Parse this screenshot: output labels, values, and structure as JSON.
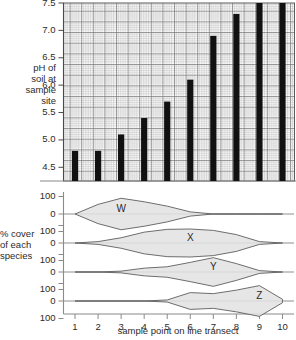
{
  "labels": {
    "y_ph": "pH of\nsoil at\nsample\nsite",
    "y_ph_lines": [
      "pH of",
      "soil at",
      "sample",
      "site"
    ],
    "y_cover_lines": [
      "% cover",
      "of each",
      "species"
    ],
    "x_axis": "sample point on line transect"
  },
  "colors": {
    "bar": "#111111",
    "grid_minor": "#b9b9b9",
    "grid_major": "#6a6a6a",
    "axis": "#8a8a8a",
    "kite_stroke": "#5d5d5d",
    "kite_fill": "#e2e2e2",
    "text": "#2b2b2b"
  },
  "chart_data": [
    {
      "type": "bar",
      "title": "",
      "xlabel": "sample point on line transect",
      "ylabel": "pH of soil at sample site",
      "categories": [
        1,
        2,
        3,
        4,
        5,
        6,
        7,
        8,
        9,
        10
      ],
      "values": [
        4.8,
        4.8,
        5.1,
        5.4,
        5.7,
        6.1,
        6.9,
        7.3,
        7.6,
        7.6
      ],
      "ylim": [
        4.25,
        7.5
      ],
      "ytick_labels": [
        "7.5",
        "7.0",
        "6.5",
        "6.0",
        "5.5",
        "5.0",
        "4.5"
      ],
      "yticks": [
        7.5,
        7.0,
        6.5,
        6.0,
        5.5,
        5.0,
        4.5
      ],
      "grid": "graph-paper minor 0.05 / major 0.25",
      "legend": "none"
    },
    {
      "type": "area",
      "title": "",
      "xlabel": "sample point on line transect",
      "ylabel": "% cover of each species",
      "chart_style": "kite diagram",
      "x": [
        1,
        2,
        3,
        4,
        5,
        6,
        7,
        8,
        9,
        10
      ],
      "ytick_labels": [
        "100",
        "0",
        "100"
      ],
      "ylim": [
        -100,
        100
      ],
      "series": [
        {
          "name": "W",
          "values": [
            0,
            55,
            90,
            70,
            45,
            12,
            0,
            0,
            0,
            0
          ]
        },
        {
          "name": "X",
          "values": [
            0,
            8,
            30,
            62,
            78,
            80,
            72,
            48,
            8,
            0
          ]
        },
        {
          "name": "Y",
          "values": [
            0,
            0,
            5,
            22,
            30,
            55,
            82,
            48,
            8,
            0
          ]
        },
        {
          "name": "Z",
          "values": [
            0,
            0,
            0,
            0,
            6,
            48,
            42,
            62,
            88,
            10
          ]
        }
      ],
      "legend": "inline species letters W, X, Y, Z"
    }
  ],
  "kite_labels": [
    "W",
    "X",
    "Y",
    "Z"
  ],
  "x_tick_labels": [
    "1",
    "2",
    "3",
    "4",
    "5",
    "6",
    "7",
    "8",
    "9",
    "10"
  ],
  "ph_tick_labels": [
    "7.5",
    "7.0",
    "6.5",
    "6.0",
    "5.5",
    "5.0",
    "4.5"
  ],
  "cover_tick_labels": [
    "100",
    "0",
    "100",
    "0",
    "100",
    "0",
    "100",
    "0",
    "100"
  ]
}
